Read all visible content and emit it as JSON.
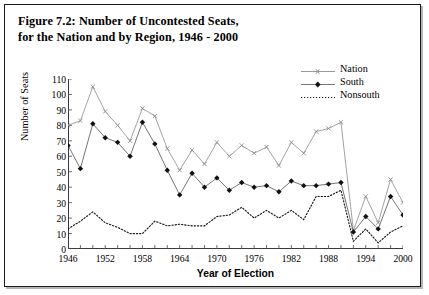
{
  "figure": {
    "caption_line1": "Figure 7.2: Number of Uncontested Seats,",
    "caption_line2": "for the Nation and by Region, 1946 - 2000"
  },
  "axes": {
    "ylabel": "Number of Seats",
    "xlabel": "Year of Election",
    "yticks": [
      "0",
      "10",
      "20",
      "30",
      "40",
      "50",
      "60",
      "70",
      "80",
      "90",
      "100",
      "110"
    ],
    "xticks": [
      "1946",
      "1952",
      "1958",
      "1964",
      "1970",
      "1976",
      "1982",
      "1988",
      "1994",
      "2000"
    ]
  },
  "legend": {
    "items": [
      {
        "label": "Nation",
        "style": "line-x-marker",
        "color": "#9a9a9a"
      },
      {
        "label": "South",
        "style": "line-diamond-marker",
        "color": "#555555"
      },
      {
        "label": "Nonsouth",
        "style": "dotted-line",
        "color": "#1a1a1a"
      }
    ]
  },
  "chart_data": {
    "type": "line",
    "title": "Figure 7.2: Number of Uncontested Seats, for the Nation and by Region, 1946 - 2000",
    "xlabel": "Year of Election",
    "ylabel": "Number of Seats",
    "xlim": [
      1946,
      2000
    ],
    "ylim": [
      0,
      110
    ],
    "ytick_step": 10,
    "xtick_step": 2,
    "xtick_label_step": 6,
    "grid": false,
    "legend_position": "top-right",
    "x": [
      1946,
      1948,
      1950,
      1952,
      1954,
      1956,
      1958,
      1960,
      1962,
      1964,
      1966,
      1968,
      1970,
      1972,
      1974,
      1976,
      1978,
      1980,
      1982,
      1984,
      1986,
      1988,
      1990,
      1992,
      1994,
      1996,
      1998,
      2000
    ],
    "series": [
      {
        "name": "Nation",
        "color": "#9a9a9a",
        "marker": "x",
        "values": [
          80,
          83,
          105,
          89,
          80,
          70,
          91,
          86,
          65,
          51,
          64,
          55,
          69,
          60,
          67,
          62,
          66,
          54,
          69,
          62,
          76,
          78,
          82,
          12,
          34,
          17,
          45,
          30
        ]
      },
      {
        "name": "South",
        "color": "#555555",
        "marker": "diamond",
        "values": [
          67,
          52,
          81,
          72,
          69,
          60,
          82,
          68,
          51,
          35,
          49,
          40,
          46,
          38,
          43,
          40,
          41,
          37,
          44,
          41,
          41,
          42,
          43,
          11,
          21,
          13,
          34,
          22
        ]
      },
      {
        "name": "Nonsouth",
        "color": "#1a1a1a",
        "marker": "dot",
        "values": [
          13,
          18,
          24,
          17,
          14,
          10,
          10,
          18,
          15,
          16,
          15,
          15,
          21,
          22,
          27,
          20,
          25,
          20,
          25,
          19,
          34,
          34,
          38,
          5,
          13,
          4,
          11,
          15
        ]
      }
    ]
  }
}
